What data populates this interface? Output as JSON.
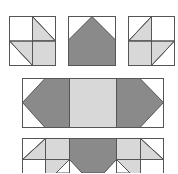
{
  "diagram": {
    "title": "",
    "colors": {
      "background": "#ffffff",
      "dark": "#8a8a8a",
      "light": "#d8d8d8",
      "outline": "#555555"
    },
    "blocks": [
      {
        "name": "left-corner-unit",
        "x": 9,
        "y": 16,
        "w": 46,
        "h": 49
      },
      {
        "name": "center-goose-unit",
        "x": 68,
        "y": 16,
        "w": 47,
        "h": 49
      },
      {
        "name": "right-corner-unit",
        "x": 128,
        "y": 16,
        "w": 46,
        "h": 49
      },
      {
        "name": "wide-strip-unit",
        "x": 22,
        "y": 78,
        "w": 141,
        "h": 49
      },
      {
        "name": "assembled-row-unit",
        "x": 22,
        "y": 138,
        "w": 141,
        "h": 40
      }
    ]
  }
}
